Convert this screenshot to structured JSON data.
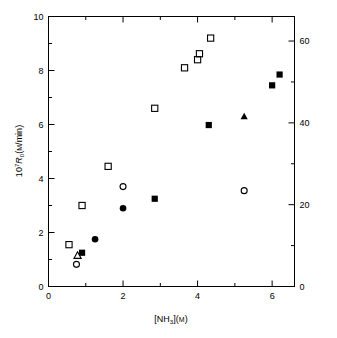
{
  "chart_data": {
    "type": "scatter",
    "title": "",
    "xlabel": "[NH3](M)",
    "xlabel_parts": {
      "pre": "[NH",
      "sub": "3",
      "mid": "](",
      "unit": "M",
      "post": ")"
    },
    "ylabel": "10^7 R0 (M/min)",
    "ylabel_parts": {
      "base": "10",
      "sup": "7",
      "sym": "R",
      "sub": "0",
      "open": "(",
      "unit": "M",
      "post": "/min)"
    },
    "ylabel_right": "",
    "xlim": [
      0,
      6.6
    ],
    "ylim": [
      0,
      10
    ],
    "ylim_right": [
      0,
      66
    ],
    "grid": false,
    "legend": "none",
    "xticks": [
      0,
      2,
      4,
      6
    ],
    "xticklabels": [
      "0",
      "2",
      "4",
      "6"
    ],
    "xminorticks": [
      1,
      3,
      5
    ],
    "yticks": [
      0,
      2,
      4,
      6,
      8,
      10
    ],
    "yticklabels": [
      "0",
      "2",
      "4",
      "6",
      "8",
      "10"
    ],
    "yminorticks": [
      1,
      3,
      5,
      7,
      9
    ],
    "yticks_right": [
      0,
      20,
      40,
      60
    ],
    "yticklabels_right": [
      "0",
      "20",
      "40",
      "60"
    ],
    "yminorticks_right": [
      10,
      30,
      50
    ],
    "series": [
      {
        "name": "open-square",
        "marker": "open-square",
        "color": "#000000",
        "points": [
          {
            "x": 0.55,
            "y": 1.55
          },
          {
            "x": 0.9,
            "y": 3.0
          },
          {
            "x": 1.6,
            "y": 4.45
          },
          {
            "x": 2.85,
            "y": 6.6
          },
          {
            "x": 3.65,
            "y": 8.1
          },
          {
            "x": 4.0,
            "y": 8.4
          },
          {
            "x": 4.05,
            "y": 8.62
          },
          {
            "x": 4.35,
            "y": 9.2
          }
        ]
      },
      {
        "name": "open-circle",
        "marker": "open-circle",
        "color": "#000000",
        "points": [
          {
            "x": 0.75,
            "y": 0.82
          },
          {
            "x": 2.0,
            "y": 3.7
          },
          {
            "x": 5.25,
            "y": 3.55
          }
        ]
      },
      {
        "name": "open-triangle",
        "marker": "open-triangle",
        "color": "#000000",
        "points": [
          {
            "x": 0.78,
            "y": 1.15
          }
        ]
      },
      {
        "name": "filled-square",
        "marker": "filled-square",
        "color": "#000000",
        "points": [
          {
            "x": 0.9,
            "y": 1.25
          },
          {
            "x": 2.85,
            "y": 3.25
          },
          {
            "x": 4.3,
            "y": 5.98
          },
          {
            "x": 6.0,
            "y": 7.45
          },
          {
            "x": 6.2,
            "y": 7.85
          }
        ]
      },
      {
        "name": "filled-circle",
        "marker": "filled-circle",
        "color": "#000000",
        "points": [
          {
            "x": 1.25,
            "y": 1.75
          },
          {
            "x": 2.0,
            "y": 2.9
          }
        ]
      },
      {
        "name": "filled-triangle",
        "marker": "filled-triangle",
        "color": "#000000",
        "points": [
          {
            "x": 5.25,
            "y": 6.3
          }
        ]
      }
    ]
  },
  "style": {
    "axis_color": "#000000",
    "background": "#ffffff",
    "marker_color": "#000000"
  }
}
